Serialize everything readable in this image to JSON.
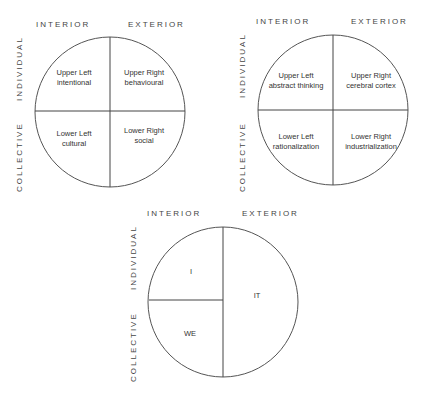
{
  "diagrams": [
    {
      "id": "quadrants-basic",
      "top_labels": [
        "INTERIOR",
        "EXTERIOR"
      ],
      "side_labels": [
        "INDIVIDUAL",
        "COLLECTIVE"
      ],
      "quadrants": {
        "upper_left": [
          "Upper Left",
          "intentional"
        ],
        "upper_right": [
          "Upper Right",
          "behavioural"
        ],
        "lower_left": [
          "Lower Left",
          "cultural"
        ],
        "lower_right": [
          "Lower Right",
          "social"
        ]
      }
    },
    {
      "id": "quadrants-examples",
      "top_labels": [
        "INTERIOR",
        "EXTERIOR"
      ],
      "side_labels": [
        "INDIVIDUAL",
        "COLLECTIVE"
      ],
      "quadrants": {
        "upper_left": [
          "Upper Left",
          "abstract thinking"
        ],
        "upper_right": [
          "Upper Right",
          "cerebral cortex"
        ],
        "lower_left": [
          "Lower Left",
          "rationalization"
        ],
        "lower_right": [
          "Lower Right",
          "industrialization"
        ]
      }
    },
    {
      "id": "big-three",
      "top_labels": [
        "INTERIOR",
        "EXTERIOR"
      ],
      "side_labels": [
        "INDIVIDUAL",
        "COLLECTIVE"
      ],
      "regions": {
        "upper_left": "I",
        "right": "IT",
        "lower_left": "WE"
      }
    }
  ]
}
